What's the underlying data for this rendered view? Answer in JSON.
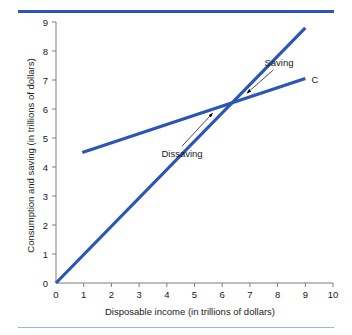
{
  "chart_data": {
    "type": "line",
    "title": "",
    "xlabel": "Disposable income (in trillions of dollars)",
    "ylabel": "Consumption and saving (in trillions of dollars)",
    "xlim": [
      0,
      10
    ],
    "ylim": [
      0,
      9
    ],
    "xticks": [
      "0",
      "1",
      "2",
      "3",
      "4",
      "5",
      "6",
      "7",
      "8",
      "9",
      "10"
    ],
    "yticks": [
      "0",
      "1",
      "2",
      "3",
      "4",
      "5",
      "6",
      "7",
      "8",
      "9"
    ],
    "grid": false,
    "legend": "none",
    "line_color": "#2B56B5",
    "axis_color": "#7d7d7d",
    "series": [
      {
        "name": "45-degree line",
        "label": "",
        "points": [
          [
            0,
            0
          ],
          [
            9,
            8.8
          ]
        ]
      },
      {
        "name": "Consumption schedule",
        "label": "C",
        "points": [
          [
            0.95,
            4.5
          ],
          [
            9,
            7.05
          ]
        ]
      }
    ],
    "annotations": [
      {
        "text": "Saving",
        "text_x": 8.05,
        "text_y": 7.6,
        "arrow_from": [
          7.85,
          7.35
        ],
        "arrow_to": [
          6.9,
          6.55
        ]
      },
      {
        "text": "Dissaving",
        "text_x": 4.55,
        "text_y": 4.45,
        "arrow_from": [
          4.55,
          4.72
        ],
        "arrow_to": [
          5.65,
          5.85
        ]
      }
    ],
    "series_labels": [
      {
        "text": "C",
        "x": 9.35,
        "y": 7.05
      }
    ]
  },
  "colors": {
    "rule_top": "#2B56B5",
    "rule_bottom": "#9fb4d8",
    "line": "#2B56B5",
    "axis": "#7d7d7d",
    "text": "#1a1a1a"
  }
}
